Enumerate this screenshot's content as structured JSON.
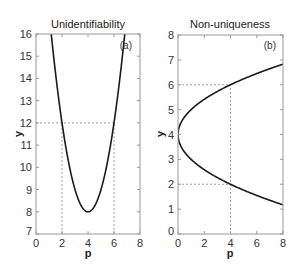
{
  "chart_data": [
    {
      "type": "line",
      "title": "Unidentifiability",
      "panel_label": "(a)",
      "xlabel": "p",
      "ylabel": "y",
      "xlim": [
        0,
        8
      ],
      "ylim": [
        7,
        16
      ],
      "xticks": [
        "0",
        "2",
        "4",
        "6",
        "8"
      ],
      "yticks": [
        "7",
        "8",
        "9",
        "10",
        "11",
        "12",
        "13",
        "14",
        "15",
        "16"
      ],
      "grid": false,
      "series": [
        {
          "name": "y = (p-4)^2 + 8",
          "x": [
            1.0,
            1.5,
            2.0,
            2.5,
            3.0,
            3.5,
            4.0,
            4.5,
            5.0,
            5.5,
            6.0,
            6.5,
            7.0
          ],
          "y": [
            17.0,
            14.25,
            12.0,
            10.25,
            9.0,
            8.25,
            8.0,
            8.25,
            9.0,
            10.25,
            12.0,
            14.25,
            17.0
          ]
        }
      ],
      "reference_lines": [
        {
          "type": "horizontal",
          "y": 12,
          "style": "dashed"
        },
        {
          "type": "vertical",
          "x": 2,
          "style": "dashed"
        },
        {
          "type": "vertical",
          "x": 6,
          "style": "dashed"
        }
      ]
    },
    {
      "type": "line",
      "title": "Non-uniqueness",
      "panel_label": "(b)",
      "xlabel": "p",
      "ylabel": "y",
      "xlim": [
        0,
        8
      ],
      "ylim": [
        0,
        8
      ],
      "xticks": [
        "0",
        "2",
        "4",
        "6",
        "8"
      ],
      "yticks": [
        "0",
        "1",
        "2",
        "3",
        "4",
        "5",
        "6",
        "7",
        "8"
      ],
      "grid": false,
      "series": [
        {
          "name": "upper branch y = 4 + sqrt(p)",
          "x": [
            0,
            0.25,
            0.5,
            1,
            2,
            3,
            4,
            5,
            6,
            7,
            8
          ],
          "y": [
            4.0,
            4.5,
            4.71,
            5.0,
            5.41,
            5.73,
            6.0,
            6.24,
            6.45,
            6.65,
            6.83
          ]
        },
        {
          "name": "lower branch y = 4 - sqrt(p)",
          "x": [
            0,
            0.25,
            0.5,
            1,
            2,
            3,
            4,
            5,
            6,
            7,
            8
          ],
          "y": [
            4.0,
            3.5,
            3.29,
            3.0,
            2.59,
            2.27,
            2.0,
            1.76,
            1.55,
            1.35,
            1.17
          ]
        }
      ],
      "reference_lines": [
        {
          "type": "horizontal",
          "y": 6,
          "style": "dashed"
        },
        {
          "type": "horizontal",
          "y": 2,
          "style": "dashed"
        },
        {
          "type": "vertical",
          "x": 4,
          "style": "dashed"
        }
      ]
    }
  ],
  "panels": {
    "a": {
      "title": "Unidentifiability",
      "label": "(a)",
      "xlabel": "p",
      "ylabel": "y",
      "xticks": [
        "0",
        "2",
        "4",
        "6",
        "8"
      ],
      "yticks": [
        "7",
        "8",
        "9",
        "10",
        "11",
        "12",
        "13",
        "14",
        "15",
        "16"
      ]
    },
    "b": {
      "title": "Non-uniqueness",
      "label": "(b)",
      "xlabel": "p",
      "ylabel": "y",
      "xticks": [
        "0",
        "2",
        "4",
        "6",
        "8"
      ],
      "yticks": [
        "0",
        "1",
        "2",
        "3",
        "4",
        "5",
        "6",
        "7",
        "8"
      ]
    }
  },
  "colors": {
    "curve": "#1a1a1a",
    "axes": "#999999",
    "reference": "#888888",
    "background": "#ffffff"
  }
}
